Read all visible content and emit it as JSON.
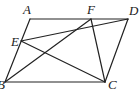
{
  "diagram": {
    "type": "geometry",
    "points": {
      "A": {
        "x": 30,
        "y": 19
      },
      "F": {
        "x": 91,
        "y": 19
      },
      "D": {
        "x": 128,
        "y": 19
      },
      "E": {
        "x": 21,
        "y": 41
      },
      "B": {
        "x": 5,
        "y": 82
      },
      "C": {
        "x": 105,
        "y": 82
      }
    },
    "labels": [
      {
        "id": "A",
        "text": "A",
        "x": 23,
        "y": 14
      },
      {
        "id": "F",
        "text": "F",
        "x": 87,
        "y": 14
      },
      {
        "id": "D",
        "text": "D",
        "x": 129,
        "y": 15
      },
      {
        "id": "E",
        "text": "E",
        "x": 11,
        "y": 46
      },
      {
        "id": "B",
        "text": "B",
        "x": -3,
        "y": 89
      },
      {
        "id": "C",
        "text": "C",
        "x": 108,
        "y": 89
      }
    ],
    "segments": [
      [
        "A",
        "D"
      ],
      [
        "A",
        "B"
      ],
      [
        "B",
        "C"
      ],
      [
        "C",
        "D"
      ],
      [
        "E",
        "D"
      ],
      [
        "E",
        "C"
      ],
      [
        "F",
        "B"
      ],
      [
        "F",
        "C"
      ]
    ],
    "stroke_color": "#222222"
  }
}
